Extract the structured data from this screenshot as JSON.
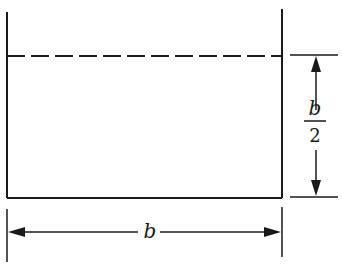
{
  "diagram": {
    "stroke_color": "#1a1a1a",
    "labels": {
      "width": "b",
      "depth_numerator": "b",
      "depth_denominator": "2"
    },
    "dimensions": {
      "width": "b",
      "depth": "b/2"
    }
  }
}
